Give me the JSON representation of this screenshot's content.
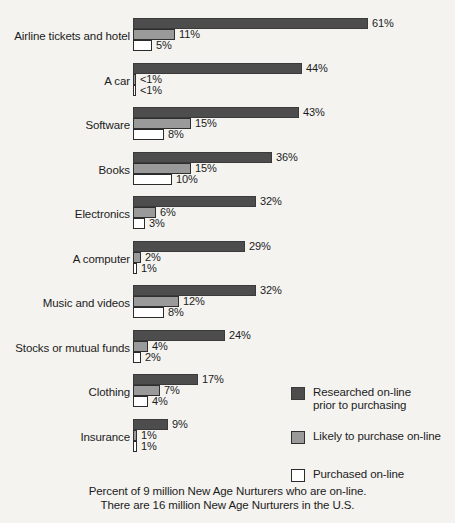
{
  "chart_data": {
    "type": "bar",
    "orientation": "horizontal",
    "title": "",
    "xlabel": "",
    "ylabel": "",
    "xlim": [
      0,
      61
    ],
    "grid": false,
    "legend_position": "right-bottom",
    "categories": [
      "Airline tickets and hotel",
      "A car",
      "Software",
      "Books",
      "Electronics",
      "A computer",
      "Music and videos",
      "Stocks or mutual funds",
      "Clothing",
      "Insurance"
    ],
    "series": [
      {
        "name": "Researched on-line prior to purchasing",
        "color": "#4d4d4d",
        "values": [
          61,
          44,
          43,
          36,
          32,
          29,
          32,
          24,
          17,
          9
        ],
        "labels": [
          "61%",
          "44%",
          "43%",
          "36%",
          "32%",
          "29%",
          "32%",
          "24%",
          "17%",
          "9%"
        ]
      },
      {
        "name": "Likely to purchase on-line",
        "color": "#9a9a9a",
        "values": [
          11,
          0.5,
          15,
          15,
          6,
          2,
          12,
          4,
          7,
          1
        ],
        "labels": [
          "11%",
          "<1%",
          "15%",
          "15%",
          "6%",
          "2%",
          "12%",
          "4%",
          "7%",
          "1%"
        ]
      },
      {
        "name": "Purchased on-line",
        "color": "#ffffff",
        "values": [
          5,
          0.5,
          8,
          10,
          3,
          1,
          8,
          2,
          4,
          1
        ],
        "labels": [
          "5%",
          "<1%",
          "8%",
          "10%",
          "3%",
          "1%",
          "8%",
          "2%",
          "4%",
          "1%"
        ]
      }
    ],
    "footnote_lines": [
      "Percent of 9 million New Age Nurturers who are on-line.",
      "There are 16 million New Age Nurturers in the U.S."
    ]
  },
  "legend": {
    "items": [
      {
        "swatch": "researched-swatch",
        "label": "Researched on-line\nprior to purchasing"
      },
      {
        "swatch": "likely-swatch",
        "label": "Likely to purchase on-line"
      },
      {
        "swatch": "purchased-swatch",
        "label": "Purchased on-line"
      }
    ]
  }
}
